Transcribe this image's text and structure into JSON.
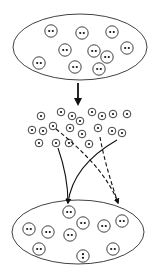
{
  "diagram": {
    "width": 160,
    "height": 276,
    "stroke_color": "#111111",
    "background": "#ffffff",
    "top_population": {
      "ellipse": {
        "cx": 80,
        "cy": 47,
        "rx": 67,
        "ry": 33
      },
      "members": [
        {
          "x": 51,
          "y": 31,
          "dots": "horizontal"
        },
        {
          "x": 82,
          "y": 33,
          "dots": "horizontal"
        },
        {
          "x": 112,
          "y": 32,
          "dots": "horizontal"
        },
        {
          "x": 65,
          "y": 50,
          "dots": "horizontal"
        },
        {
          "x": 94,
          "y": 51,
          "dots": "horizontal"
        },
        {
          "x": 127,
          "y": 48,
          "dots": "horizontal"
        },
        {
          "x": 107,
          "y": 57,
          "dots": "horizontal"
        },
        {
          "x": 39,
          "y": 63,
          "dots": "horizontal"
        },
        {
          "x": 75,
          "y": 67,
          "dots": "horizontal"
        },
        {
          "x": 99,
          "y": 69,
          "dots": "horizontal"
        }
      ]
    },
    "main_arrow": {
      "x": 78,
      "y1": 83,
      "y2": 106
    },
    "gamete_pool": [
      {
        "x": 41,
        "y": 116
      },
      {
        "x": 61,
        "y": 112
      },
      {
        "x": 72,
        "y": 116
      },
      {
        "x": 80,
        "y": 121
      },
      {
        "x": 92,
        "y": 112
      },
      {
        "x": 102,
        "y": 116
      },
      {
        "x": 113,
        "y": 114
      },
      {
        "x": 127,
        "y": 114
      },
      {
        "x": 32,
        "y": 130
      },
      {
        "x": 43,
        "y": 131
      },
      {
        "x": 53,
        "y": 126
      },
      {
        "x": 70,
        "y": 128
      },
      {
        "x": 98,
        "y": 128
      },
      {
        "x": 112,
        "y": 131
      },
      {
        "x": 122,
        "y": 133
      },
      {
        "x": 82,
        "y": 134
      },
      {
        "x": 39,
        "y": 143
      },
      {
        "x": 56,
        "y": 143
      },
      {
        "x": 69,
        "y": 143
      },
      {
        "x": 89,
        "y": 144
      }
    ],
    "connectors": [
      {
        "style": "solid",
        "path": "M58,148 C64,165 68,185 68,203"
      },
      {
        "style": "solid",
        "path": "M117,140 C96,152 72,172 68,203"
      },
      {
        "style": "dashed",
        "path": "M56,129 C82,150 108,175 118,203"
      },
      {
        "style": "dashed",
        "path": "M100,137 C104,160 112,185 118,203"
      }
    ],
    "bottom_population": {
      "ellipse": {
        "cx": 78,
        "cy": 232,
        "rx": 66,
        "ry": 32
      },
      "members": [
        {
          "x": 69,
          "y": 212,
          "dots": "horizontal"
        },
        {
          "x": 83,
          "y": 223,
          "dots": "horizontal"
        },
        {
          "x": 104,
          "y": 226,
          "dots": "horizontal"
        },
        {
          "x": 122,
          "y": 221,
          "dots": "horizontal"
        },
        {
          "x": 29,
          "y": 229,
          "dots": "horizontal"
        },
        {
          "x": 48,
          "y": 232,
          "dots": "horizontal"
        },
        {
          "x": 70,
          "y": 235,
          "dots": "horizontal"
        },
        {
          "x": 39,
          "y": 249,
          "dots": "horizontal"
        },
        {
          "x": 83,
          "y": 256,
          "dots": "vertical"
        },
        {
          "x": 113,
          "y": 249,
          "dots": "horizontal"
        }
      ]
    }
  }
}
